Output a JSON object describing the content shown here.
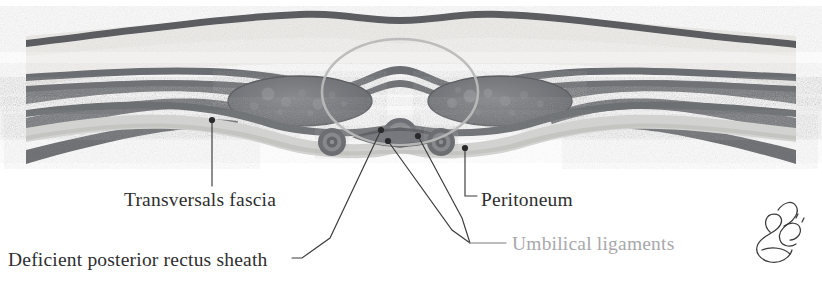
{
  "figure": {
    "type": "anatomical-illustration",
    "view": "transverse section",
    "background_color": "#ffffff"
  },
  "palette": {
    "skin_line": "#585a5e",
    "fat_layer": "#e9e9e7",
    "muscle_dark": "#6e7074",
    "muscle_mid": "#7d7f83",
    "fascia_line": "#6b6d71",
    "peritoneum_band": "#cfcfcd",
    "highlight_circle": "#b9b9b9",
    "leader_line": "#3a3a3c",
    "label_dark": "#2e2e30",
    "label_gray": "#a8a8ac",
    "signature": "#3a3a3c"
  },
  "labels": [
    {
      "id": "transversals-fascia",
      "text": "Transversals fascia",
      "color": "#2e2e30",
      "x": 124,
      "y": 206,
      "leader": {
        "style": "vertical",
        "dot": [
          212,
          120
        ]
      }
    },
    {
      "id": "deficient-posterior-rectus-sheath",
      "text": "Deficient posterior rectus sheath",
      "color": "#2e2e30",
      "x": 8,
      "y": 266,
      "leader": {
        "style": "diagonal-dash",
        "dot": [
          381,
          130
        ]
      }
    },
    {
      "id": "peritoneum",
      "text": "Peritoneum",
      "color": "#2e2e30",
      "x": 481,
      "y": 206,
      "leader": {
        "style": "elbow",
        "dot": [
          465,
          148
        ]
      }
    },
    {
      "id": "umbilical-ligaments",
      "text": "Umbilical ligaments",
      "color": "#a8a8ac",
      "x": 512,
      "y": 250,
      "leader": {
        "style": "double-converging",
        "dots": [
          [
            388,
            141
          ],
          [
            418,
            136
          ]
        ]
      }
    }
  ],
  "annotations": {
    "highlight_circle": {
      "name": "umbilical-region-highlight",
      "center": [
        400,
        92
      ],
      "radius_x": 78,
      "radius_y": 53,
      "stroke": "#b9b9b9"
    },
    "signature": {
      "name": "artist-signature",
      "x": 765,
      "y": 240,
      "description": "cursive artist signature"
    }
  },
  "structures": [
    {
      "id": "skin",
      "name": "skin",
      "layer": 1
    },
    {
      "id": "subcutaneous-fat",
      "name": "subcutaneous fat",
      "layer": 2
    },
    {
      "id": "external-oblique",
      "name": "external oblique muscle",
      "layer": 3
    },
    {
      "id": "internal-oblique",
      "name": "internal oblique muscle",
      "layer": 4
    },
    {
      "id": "transversus-abdominis",
      "name": "transversus abdominis muscle",
      "layer": 5
    },
    {
      "id": "rectus-abdominis-left",
      "name": "left rectus abdominis muscle",
      "layer": 6
    },
    {
      "id": "rectus-abdominis-right",
      "name": "right rectus abdominis muscle",
      "layer": 6
    },
    {
      "id": "linea-alba",
      "name": "linea alba",
      "layer": 6
    },
    {
      "id": "transversalis-fascia",
      "name": "transversalis fascia",
      "layer": 7
    },
    {
      "id": "peritoneum",
      "name": "peritoneum",
      "layer": 8
    },
    {
      "id": "umbilicus",
      "name": "umbilicus",
      "layer": 9
    },
    {
      "id": "umbilical-ligament-left",
      "name": "left medial umbilical ligament",
      "layer": 9
    },
    {
      "id": "umbilical-ligament-right",
      "name": "right medial umbilical ligament",
      "layer": 9
    }
  ]
}
